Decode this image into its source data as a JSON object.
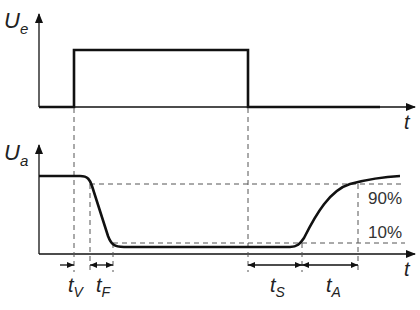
{
  "diagram": {
    "type": "switching-timing-diagram",
    "top_plot": {
      "y_axis_label": "U",
      "y_axis_subscript": "e",
      "x_axis_label": "t",
      "signal": "rectangular input pulse"
    },
    "bottom_plot": {
      "y_axis_label": "U",
      "y_axis_subscript": "a",
      "x_axis_label": "t",
      "signal": "inverted output response with delay and transition times",
      "levels": {
        "upper": "90%",
        "lower": "10%"
      }
    },
    "intervals": [
      {
        "symbol": "t",
        "subscript": "V"
      },
      {
        "symbol": "t",
        "subscript": "F"
      },
      {
        "symbol": "t",
        "subscript": "S"
      },
      {
        "symbol": "t",
        "subscript": "A"
      }
    ]
  }
}
